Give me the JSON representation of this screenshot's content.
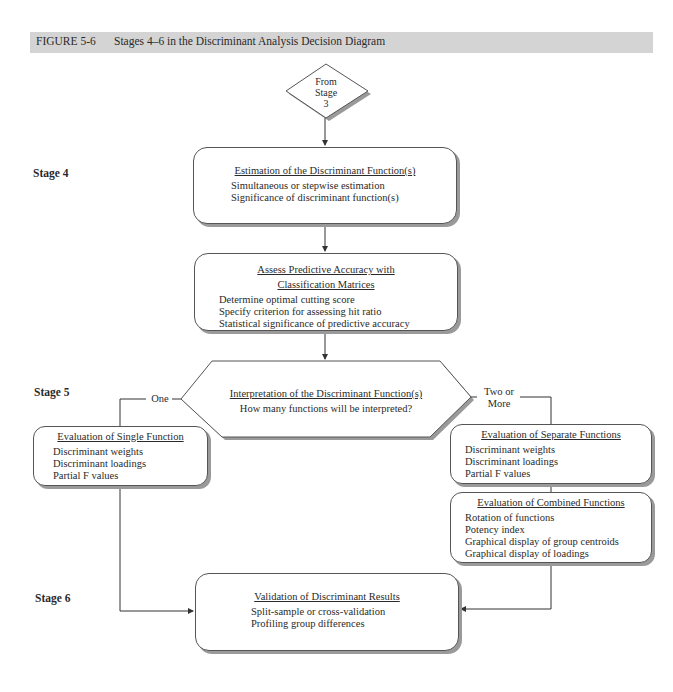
{
  "figure": {
    "top_partial_text": "...ponents to be graphed (...), ...",
    "label": "FIGURE 5-6",
    "title": "Stages 4–6 in the Discriminant Analysis Decision Diagram",
    "header_color": "#d4d4d4"
  },
  "stages": {
    "stage4": "Stage 4",
    "stage5": "Stage 5",
    "stage6": "Stage 6"
  },
  "start": {
    "line1": "From",
    "line2": "Stage",
    "line3": "3"
  },
  "estimation": {
    "title": "Estimation of the Discriminant Function(s)",
    "items": [
      "Simultaneous or stepwise estimation",
      "Significance of discriminant function(s)"
    ]
  },
  "accuracy": {
    "title_line1": "Assess Predictive Accuracy with",
    "title_line2": "Classification Matrices",
    "items": [
      "Determine optimal cutting score",
      "Specify criterion for assessing hit ratio",
      "Statistical significance of predictive accuracy"
    ]
  },
  "interpretation": {
    "title": "Interpretation of the Discriminant Function(s)",
    "question": "How many functions will be interpreted?",
    "branch_left": "One",
    "branch_right_line1": "Two or",
    "branch_right_line2": "More"
  },
  "single": {
    "title": "Evaluation of Single Function",
    "items": [
      "Discriminant weights",
      "Discriminant loadings",
      "Partial F values"
    ]
  },
  "separate": {
    "title": "Evaluation of Separate Functions",
    "items": [
      "Discriminant weights",
      "Discriminant loadings",
      "Partial F values"
    ]
  },
  "combined": {
    "title": "Evaluation of Combined Functions",
    "items": [
      "Rotation of functions",
      "Potency index",
      "Graphical display of group centroids",
      "Graphical display of loadings"
    ]
  },
  "validation": {
    "title": "Validation of Discriminant Results",
    "items": [
      "Split-sample or cross-validation",
      "Profiling group differences"
    ]
  }
}
